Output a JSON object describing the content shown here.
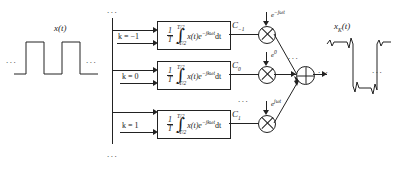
{
  "diagram": {
    "input_signal_label": "x(t)",
    "output_signal_label": "xK(t)",
    "ellipsis": "...",
    "branches": [
      {
        "k_label": "k = −1",
        "one_over": "1",
        "period": "T",
        "upper_limit": "T/2",
        "lower_limit": "−T/2",
        "integrand": "x(t)e",
        "integrand_exp": "−jkωt",
        "differential": "dt",
        "coefficient": "C",
        "coefficient_sub": "−1",
        "carrier": "e",
        "carrier_exp": "−jωt"
      },
      {
        "k_label": "k = 0",
        "one_over": "1",
        "period": "T",
        "upper_limit": "T/2",
        "lower_limit": "−T/2",
        "integrand": "x(t)e",
        "integrand_exp": "−jkωt",
        "differential": "dt",
        "coefficient": "C",
        "coefficient_sub": "0",
        "carrier": "e",
        "carrier_exp": "0"
      },
      {
        "k_label": "k = 1",
        "one_over": "1",
        "period": "T",
        "upper_limit": "T/2",
        "lower_limit": "−T/2",
        "integrand": "x(t)e",
        "integrand_exp": "−jkωt",
        "differential": "dt",
        "coefficient": "C",
        "coefficient_sub": "1",
        "carrier": "e",
        "carrier_exp": "jωt"
      }
    ],
    "colors": {
      "line": "#222222",
      "background": "#ffffff",
      "text": "#1a1a1a"
    }
  }
}
